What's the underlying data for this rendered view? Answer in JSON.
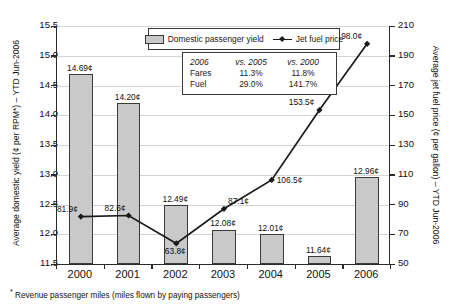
{
  "axes": {
    "left_title": "Average domestic yield (¢ per RPM*) – YTD Jun-2006",
    "right_title": "Average jet fuel price (¢ per gallon) – YTD Jun-2006"
  },
  "legend": {
    "bar_label": "Domestic passenger yield",
    "line_label": "Jet fuel price"
  },
  "stats": {
    "h1": "2006",
    "h2": "vs. 2005",
    "h3": "vs. 2000",
    "r1": {
      "label": "Fares",
      "v1": "11.3%",
      "v2": "11.8%"
    },
    "r2": {
      "label": "Fuel",
      "v1": "29.0%",
      "v2": "141.7%"
    }
  },
  "footnote": "Revenue passenger miles (miles flown by paying passengers)",
  "footnote_marker": "*",
  "chart_data": {
    "type": "bar",
    "title": "",
    "categories": [
      "2000",
      "2001",
      "2002",
      "2003",
      "2004",
      "2005",
      "2006"
    ],
    "xlabel": "",
    "ylabel": "Average domestic yield (¢ per RPM*) – YTD Jun-2006",
    "ylim": [
      11.5,
      15.5
    ],
    "yticks": [
      "15.5",
      "15.0",
      "14.5",
      "14.0",
      "13.5",
      "13.0",
      "12.5",
      "12.0",
      "11.5"
    ],
    "y2label": "Average jet fuel price (¢ per gallon) – YTD Jun-2006",
    "y2lim": [
      50,
      210
    ],
    "y2ticks": [
      "210",
      "190",
      "170",
      "150",
      "130",
      "110",
      "90",
      "70",
      "50"
    ],
    "grid": true,
    "legend_position": "top-center",
    "series": [
      {
        "name": "Domestic passenger yield",
        "type": "bar",
        "axis": "left",
        "unit": "¢",
        "values": [
          14.69,
          14.2,
          12.49,
          12.08,
          12.01,
          11.64,
          12.96
        ],
        "labels": [
          "14.69¢",
          "14.20¢",
          "12.49¢",
          "12.08¢",
          "12.01¢",
          "11.64¢",
          "12.96¢"
        ]
      },
      {
        "name": "Jet fuel price",
        "type": "line",
        "axis": "right",
        "unit": "¢",
        "values": [
          81.9,
          82.6,
          63.8,
          87.1,
          106.5,
          153.5,
          198.0
        ],
        "labels": [
          "81.9¢",
          "82.6¢",
          "63.8¢",
          "87.1¢",
          "106.5¢",
          "153.5¢",
          "198.0¢"
        ]
      }
    ]
  }
}
